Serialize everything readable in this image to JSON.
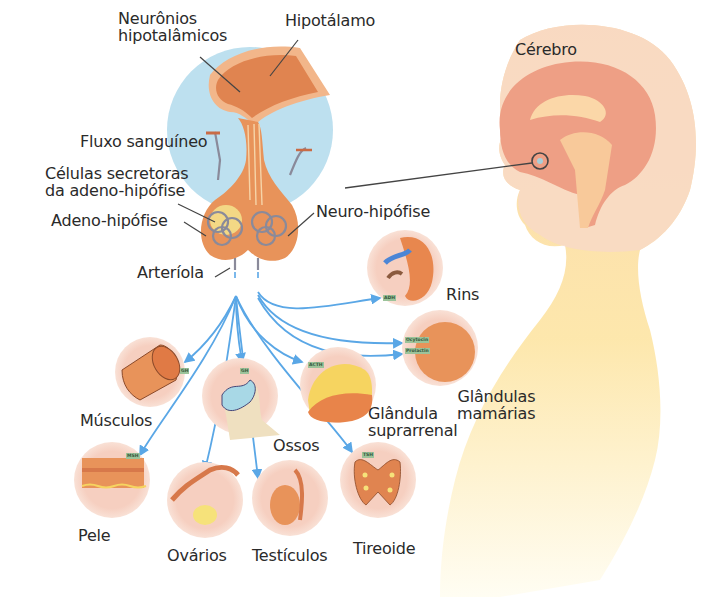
{
  "diagram": {
    "colors": {
      "pituitary_bg": "#bde0ef",
      "tissue": "#e8935a",
      "tissue_light": "#f2b68a",
      "vessel": "#8a8a9a",
      "arrow": "#5aa7e6",
      "organ_circle": "#f6d4c4",
      "head_skin": "#f9dcc2",
      "body_skin_top": "#fbd9a8",
      "body_skin_bottom": "#fff6d6",
      "brain": "#ed9e84",
      "text": "#2a2a2a"
    },
    "pituitary_labels": {
      "neuronios": "Neurônios\nhipotalâmicos",
      "hipotalamo": "Hipotálamo",
      "fluxo": "Fluxo sanguíneo",
      "celulas": "Células secretoras\nda adeno-hipófise",
      "adeno": "Adeno-hipófise",
      "neuro": "Neuro-hipófise",
      "arteriola": "Arteríola"
    },
    "brain_label": "Cérebro",
    "organs": [
      {
        "name": "Rins",
        "hormone": "ADH"
      },
      {
        "name": "Glândulas\nmamárias",
        "hormones": [
          "Ocytocin",
          "Prolactin"
        ]
      },
      {
        "name": "Músculos",
        "hormone": "GH"
      },
      {
        "name": "Ossos",
        "hormone": "GH"
      },
      {
        "name": "Glândula\nsuprarrenal",
        "hormone": "ACTH"
      },
      {
        "name": "Pele",
        "hormone": "MSH"
      },
      {
        "name": "Ovários",
        "hormone": ""
      },
      {
        "name": "Testículos",
        "hormone": ""
      },
      {
        "name": "Tireoide",
        "hormone": "TSH"
      }
    ]
  }
}
